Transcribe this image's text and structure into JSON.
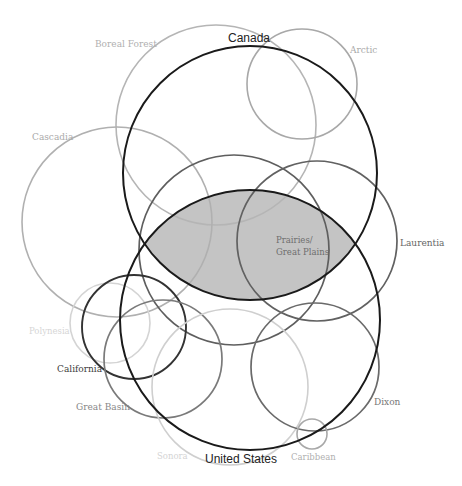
{
  "diagram": {
    "width": 462,
    "height": 486,
    "background": "#ffffff",
    "intersection": {
      "label_line1": "Prairies/",
      "label_line2": "Great Plains",
      "fill": "#c4c4c4",
      "stroke": "#1a1a1a",
      "between": [
        "Canada",
        "United States"
      ]
    },
    "circles": [
      {
        "id": "boreal-forest",
        "label": "Boreal Forest",
        "cx": 216,
        "cy": 125,
        "r": 100,
        "stroke": "#b5b5b5",
        "width": 1.6,
        "label_x": 95,
        "label_y": 47,
        "label_color": "#b0b0b0",
        "label_size": 9
      },
      {
        "id": "arctic",
        "label": "Arctic",
        "cx": 302,
        "cy": 84,
        "r": 55,
        "stroke": "#a8a8a8",
        "width": 1.6,
        "label_x": 350,
        "label_y": 53,
        "label_color": "#aaaaaa",
        "label_size": 9
      },
      {
        "id": "cascadia",
        "label": "Cascadia",
        "cx": 117,
        "cy": 222,
        "r": 95,
        "stroke": "#b0b0b0",
        "width": 1.6,
        "label_x": 32,
        "label_y": 140,
        "label_color": "#aaaaaa",
        "label_size": 9
      },
      {
        "id": "mid-west",
        "label": "",
        "cx": 234,
        "cy": 250,
        "r": 95,
        "stroke": "#5e5e5e",
        "width": 1.7
      },
      {
        "id": "laurentia",
        "label": "Laurentia",
        "cx": 317,
        "cy": 241,
        "r": 80,
        "stroke": "#616161",
        "width": 1.7,
        "label_x": 400,
        "label_y": 246,
        "label_color": "#666666",
        "label_size": 9
      },
      {
        "id": "polynesia",
        "label": "Polynesia",
        "cx": 110,
        "cy": 323,
        "r": 40,
        "stroke": "#d4d4d4",
        "width": 1.6,
        "label_x": 29,
        "label_y": 334,
        "label_color": "#d6d6d6",
        "label_size": 8.5
      },
      {
        "id": "california",
        "label": "California",
        "cx": 134,
        "cy": 327,
        "r": 52,
        "stroke": "#333333",
        "width": 1.9,
        "label_x": 57,
        "label_y": 372,
        "label_color": "#404040",
        "label_size": 9
      },
      {
        "id": "great-basin",
        "label": "Great Basin",
        "cx": 163,
        "cy": 359,
        "r": 59,
        "stroke": "#7a7a7a",
        "width": 1.7,
        "label_x": 76,
        "label_y": 410,
        "label_color": "#888888",
        "label_size": 9
      },
      {
        "id": "sonora",
        "label": "Sonora",
        "cx": 230,
        "cy": 387,
        "r": 78,
        "stroke": "#cfcfcf",
        "width": 1.6,
        "label_x": 157,
        "label_y": 459,
        "label_color": "#d4d4d4",
        "label_size": 8.5
      },
      {
        "id": "dixon",
        "label": "Dixon",
        "cx": 315,
        "cy": 367,
        "r": 64,
        "stroke": "#6a6a6a",
        "width": 1.7,
        "label_x": 374,
        "label_y": 405,
        "label_color": "#777777",
        "label_size": 9
      },
      {
        "id": "caribbean",
        "label": "Caribbean",
        "cx": 312,
        "cy": 434,
        "r": 15,
        "stroke": "#a8a8a8",
        "width": 1.6,
        "label_x": 291,
        "label_y": 460,
        "label_color": "#b0b0b0",
        "label_size": 8.5
      },
      {
        "id": "canada",
        "label": "Canada",
        "cx": 250,
        "cy": 173,
        "r": 127,
        "stroke": "#1a1a1a",
        "width": 2.0,
        "label_x": 228,
        "label_y": 42,
        "label_color": "#222222",
        "label_size": 12
      },
      {
        "id": "united-states",
        "label": "United States",
        "cx": 250,
        "cy": 320,
        "r": 130,
        "stroke": "#1a1a1a",
        "width": 2.0,
        "label_x": 205,
        "label_y": 463,
        "label_color": "#222222",
        "label_size": 12
      }
    ]
  }
}
